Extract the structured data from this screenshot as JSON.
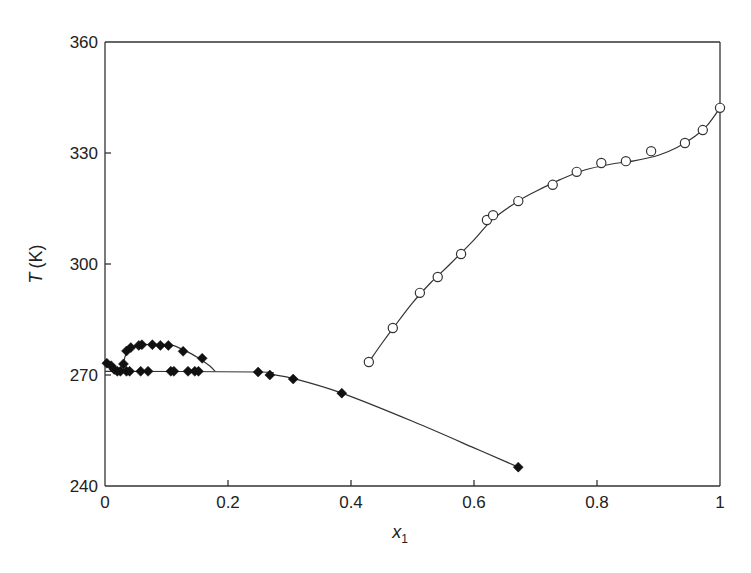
{
  "chart_data": {
    "type": "scatter",
    "title": "",
    "xlabel": "x",
    "xlabel_subscript": "1",
    "ylabel": "T",
    "ylabel_unit": "(K)",
    "xlim": [
      0,
      1
    ],
    "ylim": [
      240,
      360
    ],
    "x_ticks": [
      0,
      0.2,
      0.4,
      0.6,
      0.8,
      1
    ],
    "x_tick_labels": [
      "0",
      "0.2",
      "0.4",
      "0.6",
      "0.8",
      "1"
    ],
    "y_ticks": [
      240,
      270,
      300,
      330,
      360
    ],
    "y_tick_labels": [
      "240",
      "270",
      "300",
      "330",
      "360"
    ],
    "grid": false,
    "legend": null,
    "series": [
      {
        "name": "open-circles",
        "marker": "circle-open",
        "points": [
          [
            0.429,
            273.5
          ],
          [
            0.468,
            282.7
          ],
          [
            0.512,
            292.2
          ],
          [
            0.541,
            296.5
          ],
          [
            0.579,
            302.7
          ],
          [
            0.621,
            311.9
          ],
          [
            0.631,
            313.2
          ],
          [
            0.672,
            317.0
          ],
          [
            0.728,
            321.4
          ],
          [
            0.767,
            324.9
          ],
          [
            0.807,
            327.3
          ],
          [
            0.847,
            327.8
          ],
          [
            0.888,
            330.5
          ],
          [
            0.943,
            332.7
          ],
          [
            0.972,
            336.2
          ],
          [
            1.0,
            342.2
          ]
        ],
        "fit_curve": [
          [
            0.429,
            273.5
          ],
          [
            0.45,
            278.5
          ],
          [
            0.47,
            283.0
          ],
          [
            0.5,
            289.5
          ],
          [
            0.53,
            295.0
          ],
          [
            0.56,
            299.8
          ],
          [
            0.6,
            306.5
          ],
          [
            0.63,
            312.0
          ],
          [
            0.67,
            316.8
          ],
          [
            0.7,
            319.6
          ],
          [
            0.74,
            322.8
          ],
          [
            0.78,
            325.4
          ],
          [
            0.82,
            326.9
          ],
          [
            0.86,
            327.9
          ],
          [
            0.9,
            329.4
          ],
          [
            0.93,
            331.5
          ],
          [
            0.96,
            334.6
          ],
          [
            0.98,
            337.6
          ],
          [
            1.0,
            342.2
          ]
        ]
      },
      {
        "name": "filled-diamonds",
        "marker": "diamond-filled",
        "points": [
          [
            0.003,
            273.2
          ],
          [
            0.01,
            272.5
          ],
          [
            0.015,
            271.5
          ],
          [
            0.02,
            271.0
          ],
          [
            0.025,
            271.0
          ],
          [
            0.03,
            273.0
          ],
          [
            0.035,
            271.0
          ],
          [
            0.04,
            271.0
          ],
          [
            0.035,
            276.5
          ],
          [
            0.042,
            277.4
          ],
          [
            0.055,
            278.0
          ],
          [
            0.06,
            278.2
          ],
          [
            0.077,
            278.2
          ],
          [
            0.09,
            278.0
          ],
          [
            0.103,
            278.0
          ],
          [
            0.127,
            276.4
          ],
          [
            0.158,
            274.5
          ],
          [
            0.058,
            271.0
          ],
          [
            0.07,
            271.0
          ],
          [
            0.107,
            271.0
          ],
          [
            0.112,
            271.0
          ],
          [
            0.135,
            271.0
          ],
          [
            0.146,
            271.0
          ],
          [
            0.152,
            271.0
          ],
          [
            0.249,
            270.8
          ],
          [
            0.268,
            270.0
          ],
          [
            0.306,
            268.9
          ],
          [
            0.385,
            265.1
          ],
          [
            0.672,
            245.1
          ]
        ],
        "fit_curve_upper_arc": [
          [
            0.028,
            272.0
          ],
          [
            0.035,
            276.0
          ],
          [
            0.045,
            277.5
          ],
          [
            0.06,
            278.2
          ],
          [
            0.09,
            278.3
          ],
          [
            0.11,
            278.0
          ],
          [
            0.13,
            276.6
          ],
          [
            0.15,
            274.8
          ],
          [
            0.17,
            272.5
          ],
          [
            0.179,
            271.0
          ]
        ],
        "fit_curve_lower": [
          [
            0.0,
            271.0
          ],
          [
            0.25,
            270.8
          ],
          [
            0.27,
            270.2
          ],
          [
            0.31,
            268.9
          ],
          [
            0.385,
            265.1
          ],
          [
            0.5,
            257.5
          ],
          [
            0.6,
            250.3
          ],
          [
            0.672,
            245.1
          ]
        ],
        "fit_curve_left_tail": [
          [
            0.003,
            273.2
          ],
          [
            0.02,
            271.2
          ]
        ]
      }
    ]
  }
}
